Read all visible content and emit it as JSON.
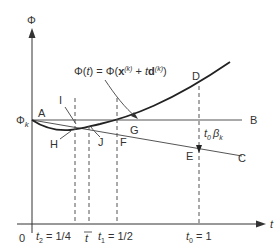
{
  "diagram": {
    "type": "line-search-backtracking",
    "axes": {
      "y_label": "Φ",
      "x_label": "t",
      "origin_label": "0",
      "phi_k_label": "Φ",
      "phi_k_subscript": "k"
    },
    "curve_label": {
      "lhs": "Φ(",
      "lhs_var": "t",
      "lhs_close": ") = Φ(",
      "x_bold": "x",
      "x_sup": "(k)",
      "plus": " + ",
      "t_var": "t",
      "d_bold": "d",
      "d_sup": "(k)",
      "close": ")"
    },
    "points": {
      "A": "A",
      "B": "B",
      "C": "C",
      "D": "D",
      "E": "E",
      "F": "F",
      "G": "G",
      "H": "H",
      "I": "I",
      "J": "J"
    },
    "step_annotation": {
      "t": "t",
      "t_sub": "0",
      "beta": "β",
      "beta_sub": "k"
    },
    "ticks": [
      {
        "var": "t",
        "sub": "2",
        "text": " = 1/4"
      },
      {
        "var": "t",
        "sub": "",
        "text": "",
        "overline": true
      },
      {
        "var": "t",
        "sub": "1",
        "text": " = 1/2"
      },
      {
        "var": "t",
        "sub": "0",
        "text": " = 1"
      }
    ]
  }
}
